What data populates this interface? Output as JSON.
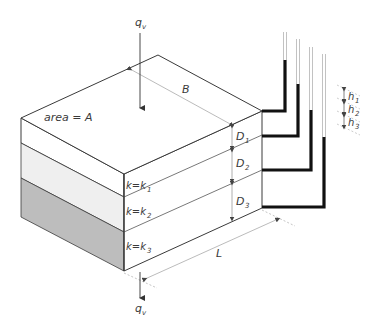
{
  "figure": {
    "labels": {
      "flow_top": "q",
      "flow_top_sub": "v",
      "flow_bottom": "q",
      "flow_bottom_sub": "v",
      "area": "area = A",
      "width": "B",
      "length": "L",
      "layer1": "k=k",
      "layer1_sub": "1",
      "layer2": "k=k",
      "layer2_sub": "2",
      "layer3": "k=k",
      "layer3_sub": "3",
      "d1": "D",
      "d1_sub": "1",
      "d2": "D",
      "d2_sub": "2",
      "d3": "D",
      "d3_sub": "3",
      "h1": "h",
      "h1_sub": "1",
      "h2": "h",
      "h2_sub": "2",
      "h3": "h",
      "h3_sub": "3"
    },
    "colors": {
      "outline": "#3a3a3a",
      "layer1_fill": "#ffffff",
      "layer2_fill": "#efefef",
      "layer3_fill": "#bdbdbd",
      "pipe_fill": "#111111",
      "dim_line": "#9a9a9a"
    }
  }
}
